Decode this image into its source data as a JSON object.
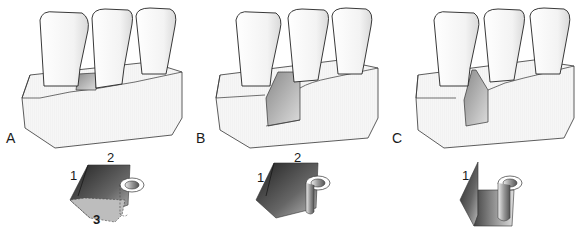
{
  "figure": {
    "panels": [
      {
        "label": "A",
        "stage": "shallow preparation between teeth",
        "block_labels": [
          "1",
          "2",
          "3"
        ]
      },
      {
        "label": "B",
        "stage": "deeper preparation",
        "block_labels": [
          "1",
          "2"
        ]
      },
      {
        "label": "C",
        "stage": "full depth preparation",
        "block_labels": [
          "1"
        ]
      }
    ]
  },
  "colors": {
    "outline": "#333333",
    "tooth_fill": "#fbfbfb",
    "base_fill": "#f4f4f4",
    "cavity_dark": "#555555"
  }
}
